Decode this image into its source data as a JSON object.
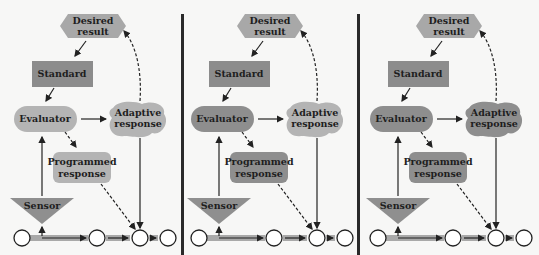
{
  "labels": {
    "desired_result": [
      "Desired",
      "result"
    ],
    "standard": "Standard",
    "evaluator": "Evaluator",
    "adaptive_response": [
      "Adaptive",
      "response"
    ],
    "programmed_response": [
      "Programmed",
      "response"
    ],
    "sensor": "Sensor"
  },
  "colors": {
    "light": "#b4b4b4",
    "dark": "#8e8e8e",
    "standard": "#8c8c8c",
    "desired": "#a8a8a8",
    "sensor": "#8f8f8f",
    "chain_bar": "#a9a9a9",
    "line": "#222222",
    "separator": "#2a2a2a",
    "background": "#f7f7f6"
  },
  "panels": [
    {
      "id": "panel-1",
      "evaluator": "light",
      "programmed": "light",
      "adaptive": "light"
    },
    {
      "id": "panel-2",
      "evaluator": "dark",
      "programmed": "dark",
      "adaptive": "light"
    },
    {
      "id": "panel-3",
      "evaluator": "dark",
      "programmed": "dark",
      "adaptive": "dark"
    }
  ]
}
